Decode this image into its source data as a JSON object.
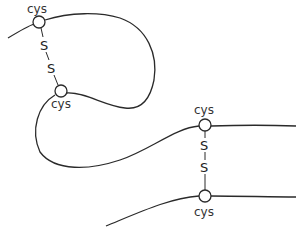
{
  "diagram": {
    "intrachain_bond": {
      "top_residue": "cys",
      "bottom_residue": "cys",
      "atom_top": "S",
      "atom_bottom": "S"
    },
    "interchain_bond": {
      "top_residue": "cys",
      "bottom_residue": "cys",
      "atom_top": "S",
      "atom_bottom": "S"
    },
    "colors": {
      "line": "#2a2a2a",
      "background": "#ffffff"
    }
  }
}
